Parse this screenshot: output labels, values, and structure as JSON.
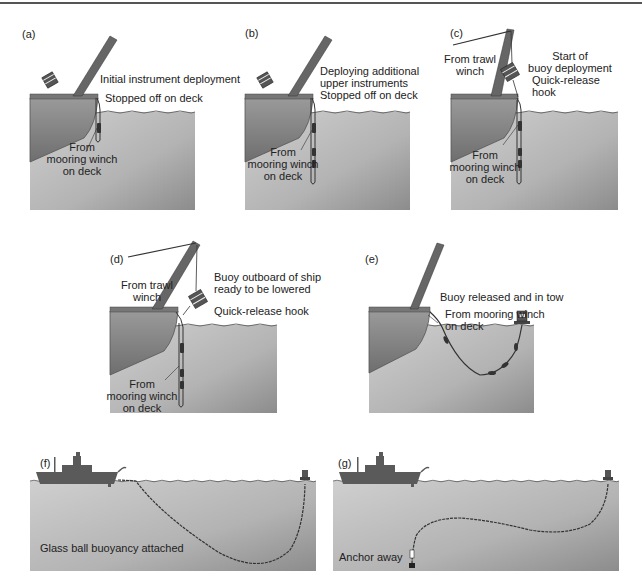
{
  "figure": {
    "colors": {
      "water_top": "#c9c9c9",
      "water_bottom": "#8f8f8f",
      "ship_hull": "#8a8a8a",
      "ship_dark": "#5a5a5a",
      "line": "#333333",
      "rule": "#555555"
    },
    "panels": [
      {
        "id": "a",
        "label": "(a)",
        "annotations": {
          "top": "Initial instrument deployment",
          "stopped": "Stopped off on deck",
          "from_line1": "From",
          "from_line2": "mooring winch",
          "from_line3": "on deck"
        }
      },
      {
        "id": "b",
        "label": "(b)",
        "annotations": {
          "top_line1": "Deploying additional",
          "top_line2": "upper instruments",
          "stopped": "Stopped off on deck",
          "from_line1": "From",
          "from_line2": "mooring winch",
          "from_line3": "on deck"
        }
      },
      {
        "id": "c",
        "label": "(c)",
        "annotations": {
          "trawl_line1": "From trawl",
          "trawl_line2": "winch",
          "start_line1": "Start of",
          "start_line2": "buoy deployment",
          "hook_line1": "Quick-release",
          "hook_line2": "hook",
          "from_line1": "From",
          "from_line2": "mooring winch",
          "from_line3": "on deck"
        }
      },
      {
        "id": "d",
        "label": "(d)",
        "annotations": {
          "trawl_line1": "From trawl",
          "trawl_line2": "winch",
          "buoy_line1": "Buoy outboard of ship",
          "buoy_line2": "ready to be lowered",
          "hook": "Quick-release hook",
          "from_line1": "From",
          "from_line2": "mooring winch",
          "from_line3": "on deck"
        }
      },
      {
        "id": "e",
        "label": "(e)",
        "annotations": {
          "released": "Buoy released and in tow",
          "from_line1": "From mooring winch",
          "from_line2": "on deck"
        }
      },
      {
        "id": "f",
        "label": "(f)",
        "annotations": {
          "caption": "Glass ball buoyancy attached"
        }
      },
      {
        "id": "g",
        "label": "(g)",
        "annotations": {
          "caption": "Anchor away"
        }
      }
    ]
  }
}
